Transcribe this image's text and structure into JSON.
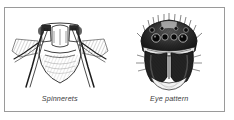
{
  "figure": {
    "panel_name": "spider-identification-figure",
    "border_color": "#9a9a9a",
    "background_color": "#ffffff",
    "ink_color": "#1d1d1d",
    "caption_color": "#3c3c3c",
    "illustrations": [
      {
        "id": "spinnerets",
        "caption": "Spinnerets",
        "subject": "spider abdomen posterior view showing spinnerets and hind legs",
        "icon_name": "spinnerets-illustration"
      },
      {
        "id": "eye-pattern",
        "caption": "Eye pattern",
        "subject": "spider carapace frontal view showing eye arrangement and chelicerae",
        "icon_name": "eye-pattern-illustration"
      }
    ]
  }
}
